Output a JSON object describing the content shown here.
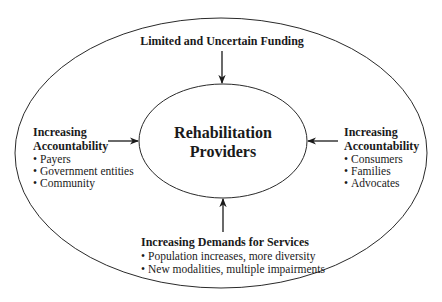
{
  "diagram": {
    "center": {
      "line1": "Rehabilitation",
      "line2": "Providers"
    },
    "top": {
      "title": "Limited and Uncertain Funding"
    },
    "left": {
      "title_line1": "Increasing",
      "title_line2": "Accountability",
      "items": [
        "Payers",
        "Government entities",
        "Community"
      ]
    },
    "right": {
      "title_line1": "Increasing",
      "title_line2": "Accountability",
      "items": [
        "Consumers",
        "Families",
        "Advocates"
      ]
    },
    "bottom": {
      "title": "Increasing Demands for Services",
      "items": [
        "Population increases, more diversity",
        "New modalities, multiple impairments"
      ]
    },
    "bullet": "•",
    "colors": {
      "stroke": "#2a2a2a",
      "text": "#1a1a1a",
      "background": "#ffffff"
    }
  }
}
